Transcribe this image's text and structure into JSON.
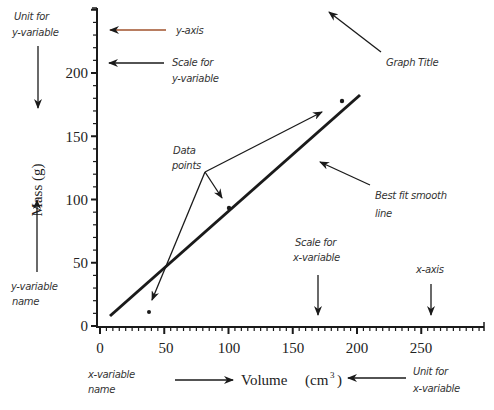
{
  "chart_data": {
    "type": "scatter",
    "title": "",
    "xlabel": "Volume (cm3)",
    "ylabel": "Mass (g)",
    "xlim": [
      0,
      298
    ],
    "ylim": [
      0,
      251
    ],
    "x_ticks": [
      0,
      50,
      100,
      150,
      200,
      250
    ],
    "y_ticks": [
      0,
      50,
      100,
      150,
      200
    ],
    "grid": false,
    "legend": null,
    "series": [
      {
        "name": "Data points",
        "type": "scatter",
        "x": [
          38,
          100,
          188
        ],
        "y": [
          11,
          93,
          178
        ]
      },
      {
        "name": "Best fit smooth line",
        "type": "line",
        "x": [
          8,
          202
        ],
        "y": [
          8,
          183
        ]
      }
    ],
    "annotations": [
      "Unit for y-variable",
      "y-axis",
      "Scale for y-variable",
      "Graph Title",
      "Data points",
      "Best fit smooth line",
      "y-variable name",
      "Scale for x-variable",
      "x-axis",
      "x-variable name",
      "Unit for x-variable"
    ]
  },
  "axes": {
    "x_label_name": "Volume",
    "x_label_unit": "(cm",
    "x_label_unit_sup": "3",
    "x_label_unit_close": ")",
    "y_label": "Mass (g)",
    "x_ticks": [
      "0",
      "50",
      "100",
      "150",
      "200",
      "250"
    ],
    "y_ticks": [
      "0",
      "50",
      "100",
      "150",
      "200"
    ]
  },
  "annotations": {
    "unit_y_line1": "Unit for",
    "unit_y_line2": "y-variable",
    "y_axis": "y-axis",
    "scale_y_line1": "Scale for",
    "scale_y_line2": "y-variable",
    "graph_title": "Graph Title",
    "data_points_line1": "Data",
    "data_points_line2": "points",
    "best_fit_line1": "Best fit smooth",
    "best_fit_line2": "line",
    "y_name_line1": "y-variable",
    "y_name_line2": "name",
    "scale_x_line1": "Scale for",
    "scale_x_line2": "x-variable",
    "x_axis": "x-axis",
    "x_name_line1": "x-variable",
    "x_name_line2": "name",
    "unit_x_line1": "Unit for",
    "unit_x_line2": "x-variable"
  },
  "colors": {
    "ink": "#1a1a1a",
    "y_axis_arrow": "#a0522d"
  }
}
